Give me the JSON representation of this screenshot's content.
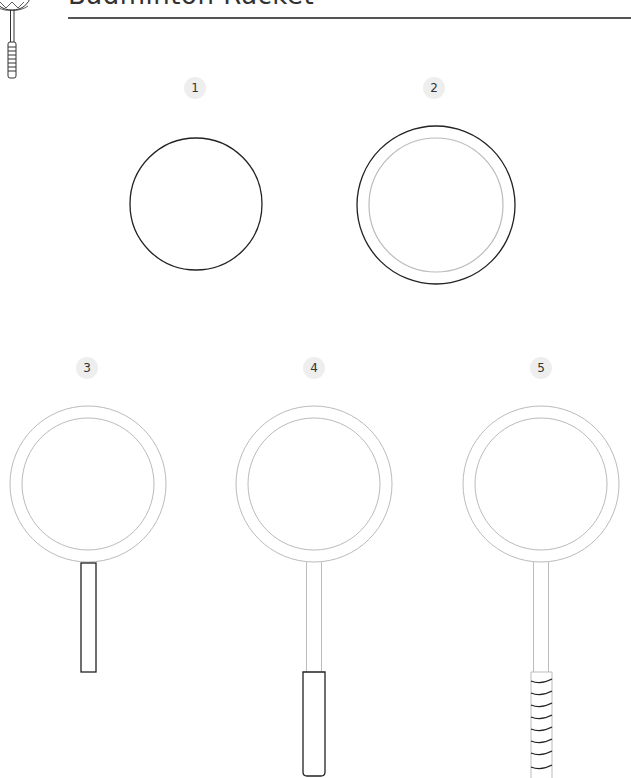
{
  "header": {
    "title": "Badminton Racket"
  },
  "colors": {
    "stroke_new": "#222222",
    "stroke_previous": "#bbbbbb",
    "badge_bg": "#eeeeee",
    "rule": "#555555"
  },
  "steps": [
    {
      "number": "1",
      "description": "Draw a circle"
    },
    {
      "number": "2",
      "description": "Draw a larger circle around it for the frame"
    },
    {
      "number": "3",
      "description": "Add the shaft"
    },
    {
      "number": "4",
      "description": "Add the handle"
    },
    {
      "number": "5",
      "description": "Add grip wraps to the handle"
    }
  ]
}
